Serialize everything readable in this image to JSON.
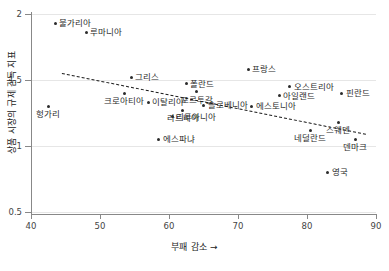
{
  "chart_data": {
    "type": "scatter",
    "title": "",
    "xlabel": "부패 감소 →",
    "ylabel": "상품 시장의 규제 감독 지표",
    "xlim": [
      40,
      90
    ],
    "ylim": [
      0.5,
      2
    ],
    "xticks": [
      "40",
      "50",
      "60",
      "70",
      "80",
      "90"
    ],
    "yticks": [
      "0.5",
      "1",
      "1.5",
      "2"
    ],
    "grid": true,
    "legend": "none",
    "points": [
      {
        "label": "불가리아",
        "x": 43.5,
        "y": 1.93,
        "lp": "right"
      },
      {
        "label": "루마니아",
        "x": 48.0,
        "y": 1.86,
        "lp": "right"
      },
      {
        "label": "그리스",
        "x": 54.5,
        "y": 1.52,
        "lp": "right"
      },
      {
        "label": "크로아티아",
        "x": 53.5,
        "y": 1.4,
        "lp": "below"
      },
      {
        "label": "이탈리아",
        "x": 57.0,
        "y": 1.33,
        "lp": "right"
      },
      {
        "label": "헝가리",
        "x": 42.5,
        "y": 1.3,
        "lp": "below"
      },
      {
        "label": "라트비아",
        "x": 62.0,
        "y": 1.27,
        "lp": "below"
      },
      {
        "label": "리투아니아",
        "x": 60.5,
        "y": 1.22,
        "lp": "right"
      },
      {
        "label": "에스파냐",
        "x": 58.5,
        "y": 1.05,
        "lp": "right"
      },
      {
        "label": "폴란드",
        "x": 62.5,
        "y": 1.47,
        "lp": "right"
      },
      {
        "label": "포르투갈",
        "x": 64.0,
        "y": 1.41,
        "lp": "below"
      },
      {
        "label": "슬로베니아",
        "x": 65.0,
        "y": 1.31,
        "lp": "right"
      },
      {
        "label": "프랑스",
        "x": 71.5,
        "y": 1.58,
        "lp": "right"
      },
      {
        "label": "에스토니아",
        "x": 72.0,
        "y": 1.3,
        "lp": "right"
      },
      {
        "label": "오스트리아",
        "x": 77.5,
        "y": 1.45,
        "lp": "right"
      },
      {
        "label": "아일랜드",
        "x": 76.0,
        "y": 1.38,
        "lp": "right"
      },
      {
        "label": "핀란드",
        "x": 85.0,
        "y": 1.4,
        "lp": "right"
      },
      {
        "label": "스웨덴",
        "x": 84.5,
        "y": 1.18,
        "lp": "below"
      },
      {
        "label": "네덜란드",
        "x": 80.5,
        "y": 1.12,
        "lp": "below"
      },
      {
        "label": "덴마크",
        "x": 87.0,
        "y": 1.05,
        "lp": "below"
      },
      {
        "label": "영국",
        "x": 83.0,
        "y": 0.8,
        "lp": "right"
      }
    ],
    "trendline": {
      "x1": 44.5,
      "y1": 1.55,
      "x2": 88.5,
      "y2": 1.09,
      "style": "dashed"
    }
  }
}
